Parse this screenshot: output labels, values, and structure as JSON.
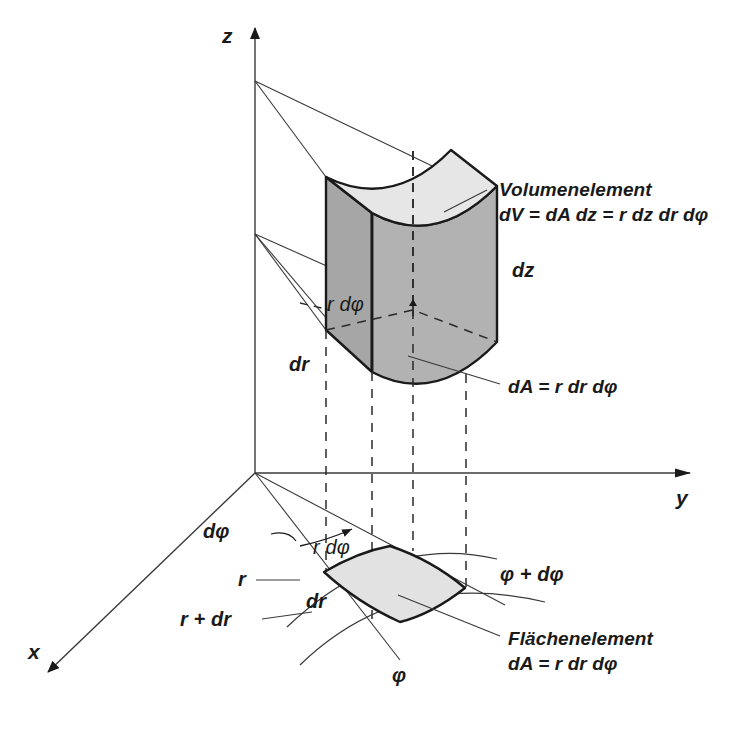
{
  "figure": {
    "language": "de",
    "colors": {
      "line": "#1a1a1a",
      "thin_line": "#3a3a3a",
      "prism_side_dark": "#a6a6a6",
      "prism_side_light": "#b4b4b4",
      "prism_top": "#e6e6e6",
      "area_element_fill": "#e2e2e2",
      "background": "#ffffff"
    }
  },
  "axes": {
    "z": "z",
    "y": "y",
    "x": "x"
  },
  "labels": {
    "dz": "dz",
    "r_dphi_prism": "r dφ",
    "dr_prism": "dr",
    "dphi_angle": "dφ",
    "r_dphi_plane": "r dφ",
    "r": "r",
    "dr_plane": "dr",
    "r_plus_dr": "r + dr",
    "phi": "φ",
    "phi_plus_dphi": "φ + dφ"
  },
  "annotations": {
    "volume_element": {
      "title": "Volumenelement",
      "formula": "dV = dA dz = r dz dr dφ"
    },
    "area_element_upper": {
      "formula": "dA = r dr dφ"
    },
    "area_element_lower": {
      "title": "Flächenelement",
      "formula": "dA = r dr dφ"
    }
  },
  "caption": {
    "text": ""
  }
}
